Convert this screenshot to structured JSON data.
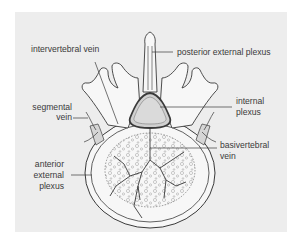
{
  "figure": {
    "type": "anatomical diagram",
    "background_color": "#ededed",
    "line_color": "#3a3a3a",
    "bone_fill": "#f7f7f7",
    "vein_fill": "#bdbdbd"
  },
  "labels": {
    "intervertebral_vein": "intervertebral vein",
    "posterior_external_plexus": "posterior external plexus",
    "segmental_vein_1": "segmental",
    "segmental_vein_2": "vein",
    "internal_plexus_1": "internal",
    "internal_plexus_2": "plexus",
    "basivertebral_vein_1": "basivertebral",
    "basivertebral_vein_2": "vein",
    "anterior_external_plexus_1": "anterior",
    "anterior_external_plexus_2": "external",
    "anterior_external_plexus_3": "plexus"
  }
}
